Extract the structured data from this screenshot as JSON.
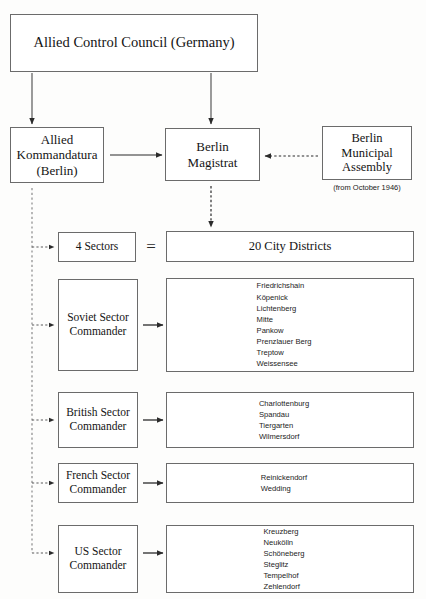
{
  "diagram": {
    "title_box": {
      "label": "Allied Control Council (Germany)"
    },
    "kommandatura_box": {
      "line1": "Allied",
      "line2": "Kommandatura",
      "line3": "(Berlin)"
    },
    "magistrat_box": {
      "line1": "Berlin",
      "line2": "Magistrat"
    },
    "assembly_box": {
      "line1": "Berlin",
      "line2": "Municipal",
      "line3": "Assembly",
      "note": "(from October 1946)"
    },
    "sectors_box": {
      "label": "4 Sectors"
    },
    "equals": {
      "symbol": "="
    },
    "districts_box": {
      "label": "20 City Districts"
    },
    "sectors": [
      {
        "commander_line1": "Soviet Sector",
        "commander_line2": "Commander",
        "districts": [
          "Friedrichshain",
          "Köpenick",
          "Lichtenberg",
          "Mitte",
          "Pankow",
          "Prenzlauer Berg",
          "Treptow",
          "Weissensee"
        ]
      },
      {
        "commander_line1": "British Sector",
        "commander_line2": "Commander",
        "districts": [
          "Charlottenburg",
          "Spandau",
          "Tiergarten",
          "Wilmersdorf"
        ]
      },
      {
        "commander_line1": "French Sector",
        "commander_line2": "Commander",
        "districts": [
          "Reinickendorf",
          "Wedding"
        ]
      },
      {
        "commander_line1": "US Sector",
        "commander_line2": "Commander",
        "districts": [
          "Kreuzberg",
          "Neukölln",
          "Schöneberg",
          "Steglitz",
          "Tempelhof",
          "Zehlendorf"
        ]
      }
    ],
    "colors": {
      "box_border": "#6b6b6b",
      "background": "#fdfdfc",
      "text": "#141414",
      "connector": "#2b2b2b"
    }
  }
}
